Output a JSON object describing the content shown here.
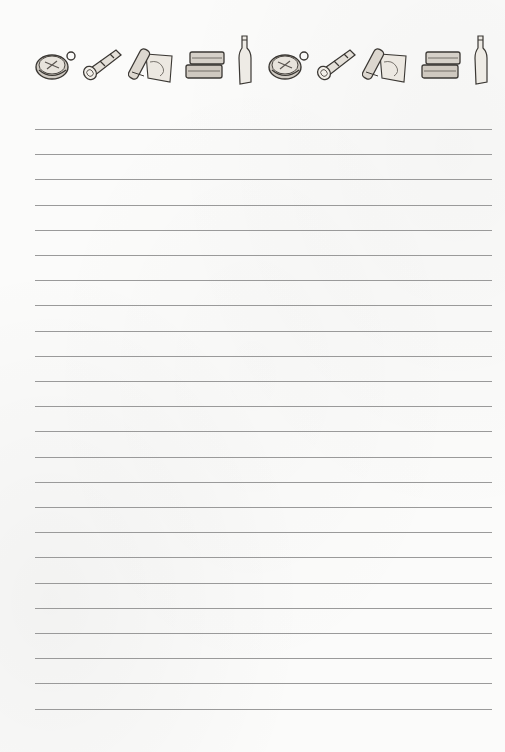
{
  "page": {
    "type": "lined-notepaper",
    "background_color": "#fbfbfa",
    "line_color": "#9a9a9a"
  },
  "header": {
    "decorations": [
      {
        "icon": "compass-icon"
      },
      {
        "icon": "spyglass-icon"
      },
      {
        "icon": "scroll-map-icon"
      },
      {
        "icon": "books-stack-icon"
      },
      {
        "icon": "bottle-icon"
      },
      {
        "icon": "compass-icon"
      },
      {
        "icon": "spyglass-icon"
      },
      {
        "icon": "scroll-map-icon"
      },
      {
        "icon": "books-stack-icon"
      },
      {
        "icon": "bottle-icon"
      }
    ]
  },
  "ruled_lines": {
    "count": 24,
    "first_y": 129,
    "spacing": 25.2,
    "left_x": 35,
    "right_x": 492
  }
}
